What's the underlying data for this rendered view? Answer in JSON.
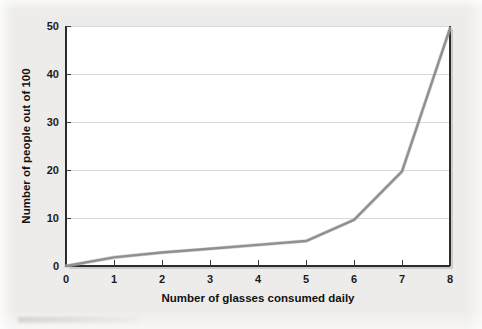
{
  "figure": {
    "background_color": "#eeecea",
    "plot_background_color": "#ffffff",
    "line_color": "#909090",
    "grid_color": "#d9d9d9",
    "axis_color": "#2b2b2b"
  },
  "chart_data": {
    "type": "line",
    "title": "",
    "xlabel": "Number of glasses consumed daily",
    "ylabel": "Number of people out of 100",
    "x": [
      0,
      1,
      2,
      3,
      4,
      5,
      6,
      7,
      8
    ],
    "values": [
      0,
      1.8,
      2.8,
      3.6,
      4.4,
      5.2,
      9.6,
      19.7,
      49.5
    ],
    "series": [
      {
        "name": "People out of 100",
        "values": [
          0,
          1.8,
          2.8,
          3.6,
          4.4,
          5.2,
          9.6,
          19.7,
          49.5
        ]
      }
    ],
    "xlim": [
      0,
      8
    ],
    "ylim": [
      0,
      50
    ],
    "xticks": [
      0,
      1,
      2,
      3,
      4,
      5,
      6,
      7,
      8
    ],
    "yticks": [
      0,
      10,
      20,
      30,
      40,
      50
    ],
    "xtick_labels": [
      "0",
      "1",
      "2",
      "3",
      "4",
      "5",
      "6",
      "7",
      "8"
    ],
    "ytick_labels": [
      "0",
      "10",
      "20",
      "30",
      "40",
      "50"
    ],
    "grid": "horizontal",
    "legend": "none"
  }
}
